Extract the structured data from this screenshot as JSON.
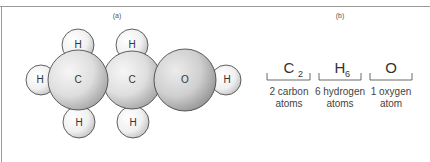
{
  "panels": {
    "a": {
      "label": "(a)"
    },
    "b": {
      "label": "(b)"
    }
  },
  "molecule": {
    "name": "ethanol-like space-filling model",
    "atoms": [
      {
        "id": "c1",
        "symbol": "C"
      },
      {
        "id": "c2",
        "symbol": "C"
      },
      {
        "id": "o",
        "symbol": "O"
      },
      {
        "id": "h-left",
        "symbol": "H"
      },
      {
        "id": "h-top-1",
        "symbol": "H"
      },
      {
        "id": "h-top-2",
        "symbol": "H"
      },
      {
        "id": "h-bottom-1",
        "symbol": "H"
      },
      {
        "id": "h-bottom-2",
        "symbol": "H"
      },
      {
        "id": "h-right",
        "symbol": "H"
      }
    ]
  },
  "formula": {
    "groups": [
      {
        "element": "C",
        "subscript": "2",
        "desc_line1": "2 carbon",
        "desc_line2": "atoms"
      },
      {
        "element": "H",
        "subscript": "6",
        "desc_line1": "6 hydrogen",
        "desc_line2": "atoms"
      },
      {
        "element": "O",
        "subscript": "",
        "desc_line1": "1 oxygen",
        "desc_line2": "atom"
      }
    ]
  },
  "colors": {
    "frame": "#9a9a9a",
    "outline": "#3a3a3a",
    "text": "#333333"
  }
}
